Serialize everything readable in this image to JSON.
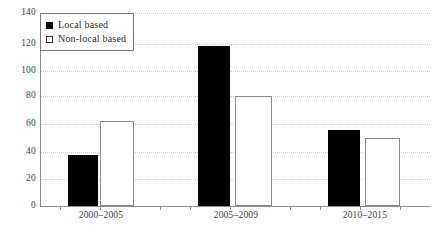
{
  "chart_data": {
    "type": "bar",
    "title": "",
    "xlabel": "",
    "ylabel": "",
    "categories": [
      "2000–2005",
      "2005–2009",
      "2010–2015"
    ],
    "series": [
      {
        "name": "Local based",
        "values": [
          37,
          116,
          55
        ],
        "color": "#000000"
      },
      {
        "name": "Non-local based",
        "values": [
          62,
          80,
          49
        ],
        "color": "#ffffff"
      }
    ],
    "ylim": [
      0,
      140
    ],
    "yticks": [
      0,
      20,
      40,
      60,
      80,
      100,
      120,
      140
    ],
    "ytick_labels": [
      "0",
      "20",
      "40",
      "60",
      "80",
      "100",
      "120",
      "140"
    ],
    "grid": true,
    "grid_style": "dotted",
    "legend_position": "top-left",
    "legend": [
      {
        "label": "Local based",
        "marker": "filled-square"
      },
      {
        "label": "Non-local based",
        "marker": "open-square"
      }
    ]
  }
}
